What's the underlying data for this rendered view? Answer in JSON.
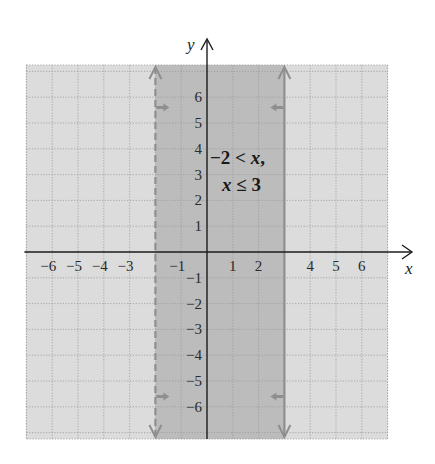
{
  "chart_data": {
    "type": "region",
    "title": "",
    "xlabel": "x",
    "ylabel": "y",
    "xlim": [
      -7,
      7
    ],
    "ylim": [
      -7.25,
      7.25
    ],
    "grid": true,
    "grid_style": "dotted",
    "x_ticks": [
      -6,
      -5,
      -4,
      -3,
      -1,
      1,
      2,
      4,
      5,
      6
    ],
    "y_ticks": [
      -6,
      -5,
      -4,
      -3,
      -2,
      -1,
      1,
      2,
      3,
      4,
      5,
      6
    ],
    "shaded_region": {
      "description": "vertical band -2 < x <= 3",
      "x_min": -2,
      "x_max": 3,
      "inclusive_min": false,
      "inclusive_max": true
    },
    "boundaries": [
      {
        "equation": "x = -2",
        "x": -2,
        "style": "dashed",
        "shade_direction": "right"
      },
      {
        "equation": "x = 3",
        "x": 3,
        "style": "solid",
        "shade_direction": "left"
      }
    ],
    "annotation": {
      "line1": "−2 < x,",
      "line2": "x ≤ 3",
      "x": 0.15,
      "y": 3.4
    }
  },
  "labels": {
    "x_axis": "x",
    "y_axis": "y",
    "annotation_line1_num": "−2 < ",
    "annotation_line1_var": "x",
    "annotation_line1_end": ",",
    "annotation_line2_var": "x",
    "annotation_line2_rest": " ≤ 3"
  },
  "colors": {
    "background": "#ffffff",
    "outside_region": "#dcdcdc",
    "shaded_band": "#bcbcbc",
    "grid": "#9a9a9a",
    "boundary": "#8f8f8f",
    "axis": "#1e1e1e",
    "text": "#222222"
  }
}
